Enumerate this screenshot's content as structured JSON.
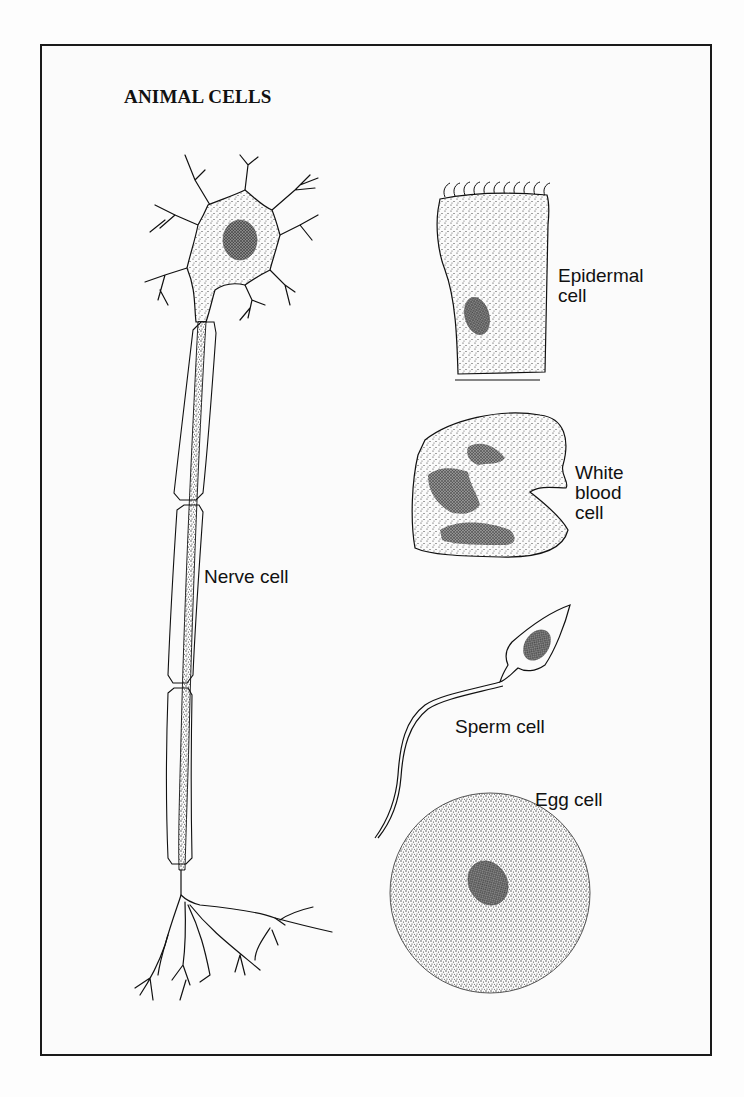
{
  "title": "ANIMAL CELLS",
  "labels": {
    "nerve": "Nerve cell",
    "epidermal_line1": "Epidermal",
    "epidermal_line2": "cell",
    "wbc_line1": "White",
    "wbc_line2": "blood",
    "wbc_line3": "cell",
    "sperm": "Sperm cell",
    "egg": "Egg cell"
  },
  "colors": {
    "ink": "#111111",
    "paper": "#fbfbfb"
  },
  "cells": [
    {
      "id": "nerve",
      "label": "Nerve cell",
      "parts": [
        "dendrites",
        "cell body",
        "nucleus",
        "myelinated axon",
        "axon terminals"
      ]
    },
    {
      "id": "epidermal",
      "label": "Epidermal cell",
      "parts": [
        "cilia",
        "cytoplasm",
        "nucleus"
      ]
    },
    {
      "id": "white-blood",
      "label": "White blood cell",
      "parts": [
        "cytoplasm",
        "lobed nucleus"
      ]
    },
    {
      "id": "sperm",
      "label": "Sperm cell",
      "parts": [
        "head",
        "nucleus",
        "tail"
      ]
    },
    {
      "id": "egg",
      "label": "Egg cell",
      "parts": [
        "cytoplasm",
        "nucleus"
      ]
    }
  ]
}
